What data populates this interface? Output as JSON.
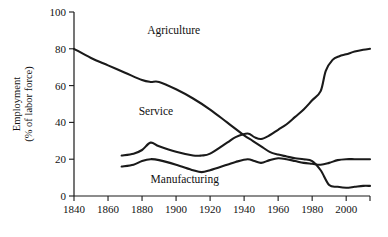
{
  "chart_data": {
    "type": "line",
    "title": "",
    "xlabel": "",
    "ylabel": "Employment (% of labor force)",
    "ylabel_line1": "Employment",
    "ylabel_line2": "(% of labor force)",
    "xlim": [
      1840,
      2014
    ],
    "ylim": [
      0,
      100
    ],
    "grid": false,
    "legend_position": "inline-annotations",
    "x_ticks": [
      1840,
      1860,
      1880,
      1900,
      1920,
      1940,
      1960,
      1980,
      2000
    ],
    "x_tick_labels": [
      "1840",
      "1860",
      "1880",
      "1900",
      "1920",
      "1940",
      "1960",
      "1980",
      "2000"
    ],
    "y_ticks": [
      0,
      20,
      40,
      60,
      80,
      100
    ],
    "y_tick_labels": [
      "0",
      "20",
      "40",
      "60",
      "80",
      "100"
    ],
    "series": [
      {
        "name": "Agriculture",
        "label": "Agriculture",
        "color": "#1a1a1a",
        "x": [
          1840,
          1850,
          1860,
          1870,
          1880,
          1885,
          1890,
          1900,
          1910,
          1920,
          1930,
          1940,
          1945,
          1950,
          1955,
          1960,
          1965,
          1970,
          1975,
          1980,
          1985,
          1990,
          1995,
          2000,
          2005,
          2010,
          2014
        ],
        "y": [
          80,
          75,
          71,
          67,
          63,
          62,
          62,
          58,
          53,
          47,
          40,
          33,
          30,
          27,
          24,
          22.5,
          21.5,
          20.5,
          20,
          19,
          14,
          6,
          5,
          4.5,
          5,
          5.5,
          5.5
        ]
      },
      {
        "name": "Service",
        "label": "Service",
        "color": "#1a1a1a",
        "x": [
          1868,
          1875,
          1880,
          1885,
          1890,
          1900,
          1910,
          1915,
          1920,
          1930,
          1935,
          1942,
          1946,
          1950,
          1955,
          1960,
          1965,
          1970,
          1975,
          1980,
          1985,
          1988,
          1992,
          1996,
          2000,
          2005,
          2010,
          2014
        ],
        "y": [
          22,
          23,
          25,
          29,
          27,
          24,
          22,
          22,
          23,
          29,
          32,
          34,
          32,
          31,
          33,
          36,
          39,
          43,
          47,
          52,
          57,
          68,
          74,
          76,
          77,
          78.5,
          79.5,
          80
        ]
      },
      {
        "name": "Manufacturing",
        "label": "Manufacturing",
        "color": "#1a1a1a",
        "x": [
          1868,
          1875,
          1880,
          1885,
          1890,
          1900,
          1910,
          1915,
          1920,
          1930,
          1935,
          1942,
          1946,
          1950,
          1955,
          1960,
          1965,
          1970,
          1975,
          1980,
          1985,
          1990,
          1995,
          2000,
          2005,
          2010,
          2014
        ],
        "y": [
          16,
          17,
          19,
          20,
          19.5,
          17,
          14,
          13,
          14,
          17,
          18.5,
          20,
          19,
          18,
          19.5,
          20.5,
          20,
          19,
          18,
          17.5,
          17,
          18,
          19.5,
          20,
          20,
          20,
          20
        ]
      }
    ],
    "annotations": [
      {
        "text": "Agriculture",
        "x": 1883,
        "y": 88
      },
      {
        "text": "Service",
        "x": 1878,
        "y": 44
      },
      {
        "text": "Manufacturing",
        "x": 1885,
        "y": 7
      }
    ]
  },
  "colors": {
    "ink": "#1a1a1a",
    "background": "#ffffff"
  }
}
